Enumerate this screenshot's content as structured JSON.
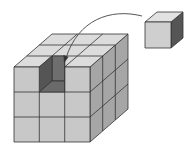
{
  "diagram": {
    "grid_size": 3,
    "colors": {
      "front": "#c9c9c9",
      "top": "#dedede",
      "side": "#a3a3a3",
      "hole_dark": "#5a5a5a",
      "hole_mid": "#7a7a7a",
      "hole_floor": "#6b6b6b",
      "small_front": "#cfcfcf",
      "small_top": "#e4e4e4",
      "small_side": "#555555",
      "stroke": "#333333",
      "arrow": "#444444"
    }
  }
}
